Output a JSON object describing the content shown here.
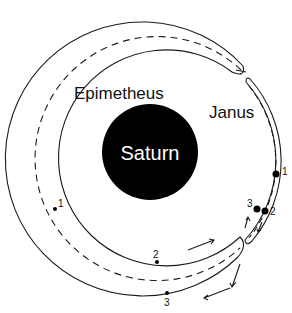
{
  "diagram": {
    "planet_label": "Saturn",
    "moon_a_label": "Epimetheus",
    "moon_b_label": "Janus",
    "epimetheus_positions": [
      "1",
      "2",
      "3"
    ],
    "janus_positions": [
      "1",
      "2",
      "3"
    ],
    "colors": {
      "line": "#1a1a1a",
      "planet": "#000000",
      "background": "#ffffff"
    }
  }
}
